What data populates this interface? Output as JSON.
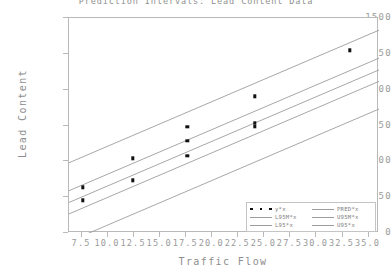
{
  "chart_data": {
    "type": "scatter",
    "title": "Prediction Intervals: Lead Content Data",
    "xlabel": "Traffic Flow",
    "ylabel": "Lead Content",
    "xlim": [
      6.25,
      36.0
    ],
    "ylim": [
      0,
      1500
    ],
    "xticks": [
      "7.5",
      "10.0",
      "12.5",
      "15.0",
      "17.5",
      "20.0",
      "22.5",
      "25.0",
      "27.5",
      "30.0",
      "32.5",
      "35.0"
    ],
    "xtick_values": [
      7.5,
      10.0,
      12.5,
      15.0,
      17.5,
      20.0,
      22.5,
      25.0,
      27.5,
      30.0,
      32.5,
      35.0
    ],
    "yticks": [
      "0",
      "250",
      "500",
      "750",
      "1000",
      "1250",
      "1500"
    ],
    "ytick_values": [
      0,
      250,
      500,
      750,
      1000,
      1250,
      1500
    ],
    "grid": false,
    "legend_position": "bottom-right",
    "points": [
      {
        "x": 7.6,
        "y": 320
      },
      {
        "x": 7.6,
        "y": 228
      },
      {
        "x": 12.4,
        "y": 520
      },
      {
        "x": 12.4,
        "y": 368
      },
      {
        "x": 17.6,
        "y": 740
      },
      {
        "x": 17.6,
        "y": 645
      },
      {
        "x": 17.6,
        "y": 540
      },
      {
        "x": 24.1,
        "y": 955
      },
      {
        "x": 24.1,
        "y": 770
      },
      {
        "x": 24.1,
        "y": 745
      },
      {
        "x": 33.2,
        "y": 1275
      }
    ],
    "series": [
      {
        "name": "y*x",
        "kind": "markers",
        "color": "#111111"
      },
      {
        "name": "PRED*x",
        "kind": "line",
        "color": "#9d9d9d",
        "intercept": 20,
        "slope": 31.0
      },
      {
        "name": "L95M*x",
        "kind": "line",
        "color": "#9d9d9d",
        "intercept": -60,
        "slope": 31.0
      },
      {
        "name": "U95M*x",
        "kind": "line",
        "color": "#9d9d9d",
        "intercept": 100,
        "slope": 31.0
      },
      {
        "name": "L95*x",
        "kind": "line",
        "color": "#9d9d9d",
        "intercept": -255,
        "slope": 31.0
      },
      {
        "name": "U95*x",
        "kind": "line",
        "color": "#9d9d9d",
        "intercept": 295,
        "slope": 31.0
      }
    ],
    "lines": [
      {
        "name": "U95*x",
        "x1": 6.25,
        "y1": 490,
        "x2": 36.0,
        "y2": 1415
      },
      {
        "name": "U95M*x",
        "x1": 6.25,
        "y1": 295,
        "x2": 36.0,
        "y2": 1220
      },
      {
        "name": "PRED*x",
        "x1": 6.25,
        "y1": 213,
        "x2": 36.0,
        "y2": 1138
      },
      {
        "name": "L95M*x",
        "x1": 6.25,
        "y1": 133,
        "x2": 36.0,
        "y2": 1058
      },
      {
        "name": "L95*x",
        "x1": 6.25,
        "y1": -60,
        "x2": 36.0,
        "y2": 865
      }
    ]
  },
  "legend": {
    "left_column": [
      {
        "label": "y*x",
        "key": "markers"
      },
      {
        "label": "L95M*x",
        "key": "line"
      },
      {
        "label": "L95*x",
        "key": "line"
      }
    ],
    "right_column": [
      {
        "label": "PRED*x",
        "key": "line"
      },
      {
        "label": "U95M*x",
        "key": "line"
      },
      {
        "label": "U95*x",
        "key": "line"
      }
    ]
  },
  "colors": {
    "marker": "#111111",
    "line": "#9d9d9d",
    "axis": "#b9b9b9",
    "text": "#8e8e8e",
    "background": "#ffffff"
  }
}
